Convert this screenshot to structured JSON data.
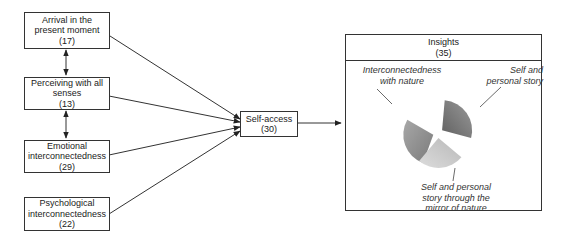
{
  "nodes": {
    "arrival": {
      "title_lines": [
        "Arrival in the",
        "present moment"
      ],
      "count": "(17)"
    },
    "perceiving": {
      "title_lines": [
        "Perceiving with all",
        "senses"
      ],
      "count": "(13)"
    },
    "emotional": {
      "title_lines": [
        "Emotional",
        "interconnectedness"
      ],
      "count": "(29)"
    },
    "psychological": {
      "title_lines": [
        "Psychological",
        "interconnectedness"
      ],
      "count": "(22)"
    },
    "self_access": {
      "title_lines": [
        "Self-access"
      ],
      "count": "(30)"
    },
    "insights": {
      "title": "Insights",
      "count": "(35)"
    }
  },
  "pie": {
    "slices": [
      {
        "label_lines": [
          "Interconnectedness",
          "with nature"
        ],
        "color": "#8c8c8c",
        "fraction": 0.3333
      },
      {
        "label_lines": [
          "Self and",
          "personal story"
        ],
        "color": "#777777",
        "fraction": 0.3333
      },
      {
        "label_lines": [
          "Self and personal",
          "story through the",
          "mirror of nature"
        ],
        "color": "#c8c8c8",
        "fraction": 0.3333
      }
    ]
  },
  "edges": [
    {
      "from": "arrival",
      "to": "self_access",
      "type": "arrow"
    },
    {
      "from": "perceiving",
      "to": "self_access",
      "type": "arrow"
    },
    {
      "from": "emotional",
      "to": "self_access",
      "type": "arrow"
    },
    {
      "from": "psychological",
      "to": "self_access",
      "type": "arrow"
    },
    {
      "from": "arrival",
      "to": "perceiving",
      "type": "bidirectional"
    },
    {
      "from": "perceiving",
      "to": "emotional",
      "type": "bidirectional"
    },
    {
      "from": "self_access",
      "to": "insights",
      "type": "arrow"
    }
  ]
}
